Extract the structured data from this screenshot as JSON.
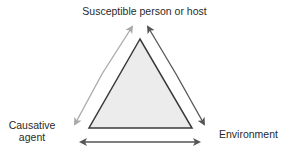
{
  "diagram": {
    "nodes": {
      "top": "Susceptible person or host",
      "left": "Causative agent",
      "right": "Environment"
    },
    "edges": [
      {
        "from": "left",
        "to": "top",
        "style": "light-gray arrow"
      },
      {
        "from": "top",
        "to": "right",
        "style": "dark arrow"
      },
      {
        "from": "left",
        "to": "right",
        "style": "double-headed dark arrow"
      }
    ],
    "colors": {
      "triangle_fill": "#ececec",
      "triangle_stroke": "#3a3a3a",
      "arrow_light": "#a8a8a8",
      "arrow_dark": "#555555"
    }
  }
}
